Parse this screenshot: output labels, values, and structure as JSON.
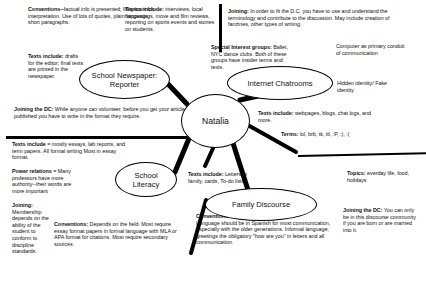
{
  "diagram": {
    "type": "mind-map",
    "center": {
      "label": "Natalia"
    },
    "nodes": [
      {
        "id": "school-newspaper",
        "label": "School Newspaper:\nReporter"
      },
      {
        "id": "internet-chatrooms",
        "label": "Internet Chatrooms"
      },
      {
        "id": "school-literacy",
        "label": "School\nLiteracy"
      },
      {
        "id": "family-discourse",
        "label": "Family Discourse"
      }
    ],
    "node_labels": {
      "newspaper_line1": "School Newspaper:",
      "newspaper_line2": "Reporter",
      "chatrooms": "Internet Chatrooms",
      "school_line1": "School",
      "school_line2": "Literacy",
      "family": "Family Discourse",
      "center": "Natalia"
    },
    "annotations": {
      "np_conventions_head": "Conventions--",
      "np_conventions_body": "factual info is presented; little room for interpretation.  Use of lots of quotes, plain language, short paragraphs.",
      "np_texts_head": "Texts include:",
      "np_texts_body": "drafts for the editor; final texts are printed in the newspaper.",
      "np_joining_head": "Joining the DC:",
      "np_joining_body": "While anyone can volunteer, before you get your articles published you have to write in the format they require.",
      "np_topics_head": "Topics include:",
      "np_topics_body": "interviews, local happenings, move and film reviews, reporting on sports events and stories on students.",
      "chat_joining_head": "Joining:",
      "chat_joining_body": "In order to fit the D.C. you have to use and understand the terminology and contribute to the discussion.  May include creation of fanzines, other types of writing.",
      "chat_special_head": "Special Interest groups:",
      "chat_special_body": "Ballet, NYC dance clubs.  Both of these groups have insider terms and texts.",
      "chat_computer": "Computer as primary conduit of communication",
      "chat_hidden": "Hidden identity/ Fake identity",
      "chat_texts_head": "Texts include:",
      "chat_texts_body": "webpages, blogs, chat logs, and more.",
      "chat_terms_head": "Terms:",
      "chat_terms_body": "lol, brb, tk, ttl, :P, :), :(",
      "sl_texts_head": "Texts include =",
      "sl_texts_body": "mostly essays, lab reports, and term papers.   All formal writing Most in essay format.",
      "sl_power_head": "Power relations =",
      "sl_power_body": "Many professors have more authority--their words are more important",
      "sl_joining_head": "Joining:",
      "sl_joining_body": "Membership depends on the ability of the student to conform to discipline standards.",
      "sl_conventions_head": "Conventions:",
      "sl_conventions_body": "Depends on the field. Most require essay format papers in formal language with MLA or APA format for citations.  Most require secondary sources.",
      "fd_texts_head": "Texts include:",
      "fd_texts_body": "Letters to family, cards, To-do lists",
      "fd_topics_head": "Topics:",
      "fd_topics_body": "everday life, food, holidays",
      "fd_conventions_head": "Conventions:",
      "fd_conventions_body": "Language should be in Spanish for most communication, especially with the older generations.  Informal language; greetings the obligatory \"how are you\" in letters and all communication.",
      "fd_joining_head": "Joining the DC:",
      "fd_joining_body": "You can only be in this discourse community if you are born or are married into it."
    },
    "colors": {
      "ink": "#000000",
      "background": "#ffffff"
    }
  }
}
